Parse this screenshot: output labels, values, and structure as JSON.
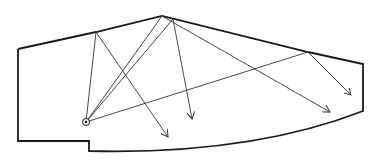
{
  "diagram": {
    "title": "",
    "colors": {
      "background": "#ffffff",
      "stroke": "#1a1a1a",
      "ray": "#333333"
    },
    "room_outline": {
      "points": [
        [
          18,
          49
        ],
        [
          96,
          32
        ],
        [
          162,
          16
        ],
        [
          308,
          52
        ],
        [
          363,
          64
        ],
        [
          363,
          111
        ]
      ],
      "curve": {
        "from": [
          363,
          111
        ],
        "control": [
          250,
          155
        ],
        "to": [
          89,
          151
        ]
      },
      "closing": [
        [
          89,
          151
        ],
        [
          89,
          141
        ],
        [
          18,
          141
        ],
        [
          18,
          49
        ]
      ]
    },
    "source": {
      "x": 86,
      "y": 122,
      "r": 3.5
    },
    "rays": [
      {
        "from": [
          86,
          122
        ],
        "to": [
          96,
          32
        ]
      },
      {
        "from": [
          86,
          122
        ],
        "to": [
          162,
          16
        ]
      },
      {
        "from": [
          86,
          122
        ],
        "to": [
          173,
          19
        ]
      },
      {
        "from": [
          86,
          122
        ],
        "to": [
          308,
          52
        ]
      }
    ],
    "reflections": [
      {
        "from": [
          96,
          32
        ],
        "to": [
          168,
          137
        ]
      },
      {
        "from": [
          162,
          16
        ],
        "to": [
          330,
          112
        ]
      },
      {
        "from": [
          173,
          19
        ],
        "to": [
          192,
          119
        ]
      },
      {
        "from": [
          308,
          52
        ],
        "to": [
          351,
          95
        ]
      }
    ]
  }
}
